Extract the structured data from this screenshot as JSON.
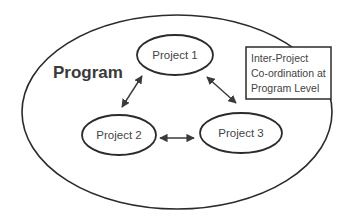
{
  "diagram": {
    "program": {
      "label": "Program"
    },
    "projects": [
      {
        "label": "Project 1"
      },
      {
        "label": "Project 2"
      },
      {
        "label": "Project 3"
      }
    ],
    "note": {
      "lines": [
        "Inter-Project",
        "Co-ordination at",
        "Program Level"
      ]
    },
    "connections": [
      {
        "from": "Project 1",
        "to": "Project 2",
        "type": "bidirectional"
      },
      {
        "from": "Project 1",
        "to": "Project 3",
        "type": "bidirectional"
      },
      {
        "from": "Project 2",
        "to": "Project 3",
        "type": "bidirectional"
      }
    ],
    "colors": {
      "stroke": "#2b2b2b",
      "text": "#444444",
      "background": "#ffffff"
    }
  }
}
